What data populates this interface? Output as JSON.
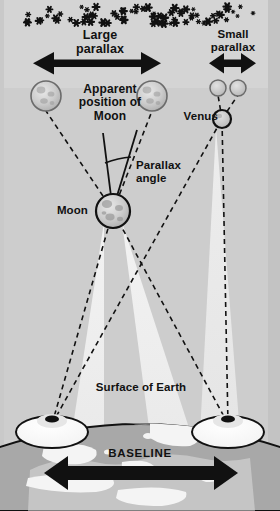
{
  "diagram": {
    "background_color": "#d2d2d2",
    "band_color": "#cfcfcf",
    "edge_strip_color": "#c4c4c4",
    "ink_color": "#111111",
    "labels": {
      "large_parallax": "Large\nparallax",
      "small_parallax": "Small\nparallax",
      "apparent_position": "Apparent\nposition of\nMoon",
      "venus": "Venus",
      "parallax_angle": "Parallax\nangle",
      "moon": "Moon",
      "surface_of_earth": "Surface of Earth",
      "baseline": "BASELINE"
    },
    "objects": {
      "moon_true": {
        "name": "moon",
        "cx": 113,
        "cy": 211,
        "r": 17
      },
      "moon_apparent_left": {
        "name": "apparent-moon-left",
        "cx": 46,
        "cy": 96,
        "r": 15
      },
      "moon_apparent_right": {
        "name": "apparent-moon-right",
        "cx": 152,
        "cy": 96,
        "r": 15
      },
      "venus_true": {
        "name": "venus",
        "cx": 222,
        "cy": 119,
        "r": 9
      },
      "venus_apparent_left": {
        "name": "apparent-venus-left",
        "cx": 218,
        "cy": 88,
        "r": 8
      },
      "venus_apparent_right": {
        "name": "apparent-venus-right",
        "cx": 238,
        "cy": 88,
        "r": 8
      },
      "observer_left": {
        "name": "observer-left",
        "cx": 52,
        "cy": 430
      },
      "observer_right": {
        "name": "observer-right",
        "cx": 228,
        "cy": 430
      }
    },
    "arrows": {
      "large_parallax": {
        "x1": 35,
        "x2": 160,
        "y": 63
      },
      "small_parallax": {
        "x1": 211,
        "x2": 254,
        "y": 63
      },
      "baseline": {
        "x1": 47,
        "x2": 234,
        "y": 473
      }
    },
    "stars": {
      "count": 72,
      "glyph": "six-point-star",
      "band_top": 6,
      "band_bottom": 24
    }
  }
}
